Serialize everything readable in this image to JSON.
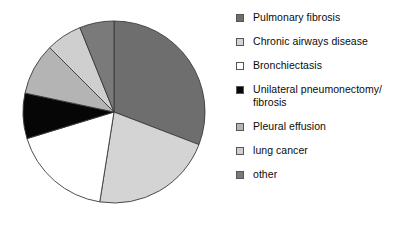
{
  "chart_data": {
    "type": "pie",
    "title": "",
    "subtitle": "",
    "xlabel": "",
    "ylabel": "",
    "grid": false,
    "legend_position": "right",
    "start_angle_deg": 0,
    "direction": "clockwise",
    "categories": [
      "Pulmonary fibrosis",
      "Chronic airways disease",
      "Bronchiectasis",
      "Unilateral pneumonectomy/\nfibrosis",
      "Pleural effusion",
      "lung cancer",
      "other"
    ],
    "values": [
      31,
      22,
      18,
      8,
      9,
      6,
      6
    ],
    "unit": "percent",
    "slices": [
      {
        "label": "Pulmonary fibrosis",
        "value": 31,
        "color": "#6e6e6e",
        "start_deg": 0,
        "end_deg": 111
      },
      {
        "label": "Chronic airways disease",
        "value": 22,
        "color": "#d4d4d4",
        "start_deg": 111,
        "end_deg": 189
      },
      {
        "label": "Bronchiectasis",
        "value": 18,
        "color": "#ffffff",
        "start_deg": 189,
        "end_deg": 253
      },
      {
        "label": "Unilateral pneumonectomy/\nfibrosis",
        "value": 8,
        "color": "#060606",
        "start_deg": 253,
        "end_deg": 282
      },
      {
        "label": "Pleural effusion",
        "value": 9,
        "color": "#b4b4b4",
        "start_deg": 282,
        "end_deg": 315
      },
      {
        "label": "lung cancer",
        "value": 6,
        "color": "#cfcfcf",
        "start_deg": 315,
        "end_deg": 338
      },
      {
        "label": "other",
        "value": 6,
        "color": "#7a7a7a",
        "start_deg": 338,
        "end_deg": 360
      }
    ],
    "slice_edge_color": "#3a3a3a",
    "center_x": 93,
    "center_y": 93,
    "radius": 91
  },
  "legend": {
    "items": [
      {
        "label": "Pulmonary fibrosis",
        "swatch_color": "#6e6e6e"
      },
      {
        "label": "Chronic airways disease",
        "swatch_color": "#d4d4d4"
      },
      {
        "label": "Bronchiectasis",
        "swatch_color": "#ffffff"
      },
      {
        "label": "Unilateral pneumonectomy/\nfibrosis",
        "swatch_color": "#060606"
      },
      {
        "label": "Pleural effusion",
        "swatch_color": "#b4b4b4"
      },
      {
        "label": "lung cancer",
        "swatch_color": "#cfcfcf"
      },
      {
        "label": "other",
        "swatch_color": "#7a7a7a"
      }
    ]
  }
}
